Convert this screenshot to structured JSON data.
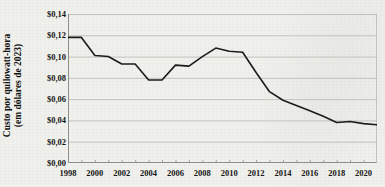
{
  "chart_data": {
    "type": "line",
    "title": "",
    "subtitle": "",
    "xlabel": "",
    "ylabel": "Custo por quilowatt-hora (em dólares de 2023)",
    "ylabel_line1": "Custo por quilowatt-hora",
    "ylabel_line2": "(em dólares de 2023)",
    "currency_symbol": "$",
    "decimal_separator": ",",
    "ylim": [
      0.0,
      0.14
    ],
    "ytick_values": [
      0.0,
      0.02,
      0.04,
      0.06,
      0.08,
      0.1,
      0.12,
      0.14
    ],
    "ytick_labels": [
      "$0,00",
      "$0,02",
      "$0,04",
      "$0,06",
      "$0,08",
      "$0,10",
      "$0,12",
      "$0,14"
    ],
    "xlim": [
      1998,
      2021
    ],
    "xtick_values": [
      1998,
      2000,
      2002,
      2004,
      2006,
      2008,
      2010,
      2012,
      2014,
      2016,
      2018,
      2020
    ],
    "xtick_labels": [
      "1998",
      "2000",
      "2002",
      "2004",
      "2006",
      "2008",
      "2010",
      "2012",
      "2014",
      "2016",
      "2018",
      "2020"
    ],
    "minor_xticks": [
      1999,
      2001,
      2003,
      2005,
      2007,
      2009,
      2011,
      2013,
      2015,
      2017,
      2019,
      2021
    ],
    "grid": {
      "horizontal": true,
      "vertical": false,
      "color": "#b9b9b4"
    },
    "legend": {
      "show": false,
      "position": "none"
    },
    "line_color": "#1b1b1b",
    "line_width": 1.6,
    "x": [
      1998,
      1999,
      2000,
      2001,
      2002,
      2003,
      2004,
      2005,
      2006,
      2007,
      2008,
      2009,
      2010,
      2011,
      2012,
      2013,
      2014,
      2015,
      2016,
      2017,
      2018,
      2019,
      2020,
      2021
    ],
    "series": [
      {
        "name": "Custo por quilowatt-hora",
        "values": [
          0.118,
          0.118,
          0.101,
          0.1,
          0.093,
          0.093,
          0.078,
          0.078,
          0.092,
          0.091,
          0.1,
          0.108,
          0.105,
          0.104,
          0.085,
          0.067,
          0.059,
          0.054,
          0.049,
          0.044,
          0.038,
          0.039,
          0.037,
          0.036
        ]
      }
    ]
  }
}
